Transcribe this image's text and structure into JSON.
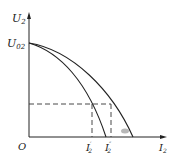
{
  "diagram": {
    "type": "external characteristic curves",
    "axes": {
      "y_label": "U",
      "y_sub": "2",
      "x_label": "I",
      "x_sub": "2",
      "origin_label": "O"
    },
    "marks": {
      "u02_label": "U",
      "u02_sub": "02",
      "i2_prime_label": "I",
      "i2_prime_sub": "2",
      "i2_prime_mark": "′",
      "i2_dprime_label": "I",
      "i2_dprime_sub": "2",
      "i2_dprime_mark": "″"
    },
    "curves": [
      {
        "name": "inner-curve",
        "from": "U02",
        "to_x_intercept": "near I2''"
      },
      {
        "name": "outer-curve",
        "from": "U02",
        "to_x_intercept": "beyond I2''"
      }
    ],
    "colors": {
      "line": "#222222",
      "dash": "#333333",
      "smudge": "#9a9a9a"
    }
  }
}
